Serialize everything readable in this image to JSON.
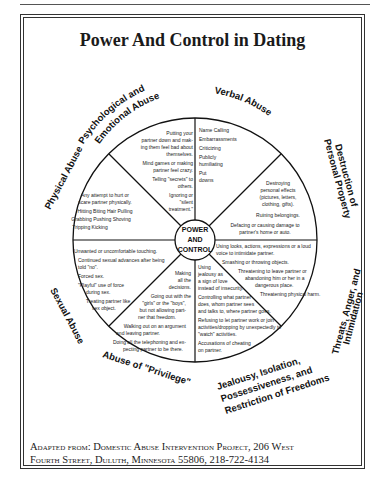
{
  "document": {
    "title": "Power And Control in Dating",
    "center": [
      "POWER",
      "AND",
      "CONTROL"
    ],
    "segments": [
      {
        "label": "Psychological and Emotional Abuse",
        "label_lines": [
          "Psychological and",
          "Emotional Abuse"
        ],
        "items": [
          "Putting your",
          "partner down and mak-",
          "ing them feel bad about",
          "themselves.",
          "Mind games or making",
          "partner feel crazy.",
          "Telling \"secrets\" to",
          "others.",
          "Ignoring or",
          "\"silent",
          "treatment.\""
        ]
      },
      {
        "label": "Verbal Abuse",
        "items": [
          "Name Calling",
          "Embarrassments",
          "Criticizing",
          "Publicly",
          "humiliating",
          "Put",
          "downs"
        ]
      },
      {
        "label": "Destruction of Personal Property",
        "label_lines": [
          "Destruction of",
          "Personal Property"
        ],
        "items": [
          "Destroying",
          "personal effects",
          "(pictures, letters,",
          "clothing, gifts).",
          "Ruining belongings.",
          "Defacing or causing damage to",
          "partner's home or auto."
        ]
      },
      {
        "label": "Threats, Anger, and Intimidation",
        "label_lines": [
          "Threats, Anger, and",
          "Intimidation"
        ],
        "items": [
          "Using looks, actions, expressions or a loud",
          "voice to intimidate partner.",
          "Smashing or throwing objects.",
          "Threatening to leave partner or",
          "abandoning him or her in a",
          "dangerous place.",
          "Threatening physical harm."
        ]
      },
      {
        "label": "Jealousy, Isolation, Possessiveness, and Restriction of Freedoms",
        "label_lines": [
          "Jealousy, Isolation,",
          "Possessiveness, and",
          "Restriction of Freedoms"
        ],
        "items": [
          "Using",
          "jealousy as",
          "a sign of love",
          "instead of insecurity.",
          "Controlling what partner",
          "does, whom partner sees",
          "and talks to, where partner goes.",
          "Refusing to let partner work or join",
          "activities/dropping by unexpectedly to",
          "\"watch\" activities.",
          "Accusations of cheating",
          "on partner."
        ]
      },
      {
        "label": "Abuse of \"Privilege\"",
        "items": [
          "Making",
          "all the",
          "decisions.",
          "Going out with the",
          "\"girls\" or the \"boys\",",
          "but not allowing part-",
          "ner that freedom.",
          "Walking out on an argument",
          "and leaving partner.",
          "Doing all the telephoning and ex-",
          "pecting partner to be there."
        ]
      },
      {
        "label": "Sexual Abuse",
        "items": [
          "Unwanted or uncomfortable touching.",
          "Continued sexual advances after being",
          "told \"no\".",
          "Forced sex.",
          "\"Playful\" use of force",
          "during sex.",
          "Treating partner like",
          "sex object."
        ]
      },
      {
        "label": "Physical Abuse",
        "items": [
          "Any attempt to hurt or",
          "scare partner physically.",
          "Hitting   Biting   Hair Pulling",
          "Grabbing   Pushing   Shoving",
          "Tripping   Kicking"
        ]
      }
    ],
    "footer": {
      "line1": "Adapted from: Domestic Abuse Intervention Project, 206 West",
      "line2": "Fourth Street, Duluth, Minnesota 55806, 218-722-4134"
    }
  }
}
